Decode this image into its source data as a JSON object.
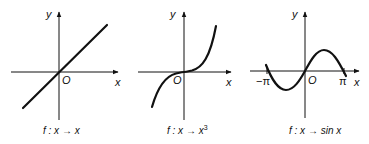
{
  "panels": [
    {
      "id": "identity",
      "axis_x_label": "x",
      "axis_y_label": "y",
      "origin_label": "O",
      "caption": {
        "prefix": "f : x",
        "arrow": "→",
        "body": "x",
        "sup": ""
      },
      "function": "f(x) = x"
    },
    {
      "id": "cube",
      "axis_x_label": "x",
      "axis_y_label": "y",
      "origin_label": "O",
      "caption": {
        "prefix": "f : x",
        "arrow": "→",
        "body": "x",
        "sup": "3"
      },
      "function": "f(x) = x^3"
    },
    {
      "id": "sine",
      "axis_x_label": "x",
      "axis_y_label": "y",
      "origin_label": "O",
      "tick_neg_pi": "−π",
      "tick_pi": "π",
      "caption": {
        "prefix": "f : x",
        "arrow": "→",
        "body": "sin x",
        "sup": ""
      },
      "function": "f(x) = sin x"
    }
  ],
  "colors": {
    "ink": "#111111",
    "background": "#ffffff"
  }
}
